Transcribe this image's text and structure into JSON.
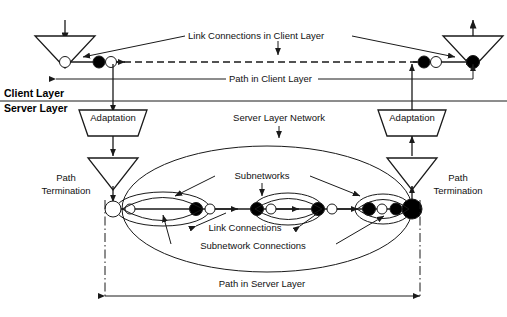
{
  "figure": {
    "background": "#ffffff",
    "line_color": "#1a1a1a"
  },
  "layers": {
    "client_label": "Client Layer",
    "server_label": "Server Layer",
    "divider_y": 101
  },
  "annotations": {
    "link_connections_client": "Link Connections in Client Layer",
    "path_client": "Path in Client Layer",
    "server_layer_network": "Server Layer Network",
    "subnetworks": "Subnetworks",
    "link_connections": "Link Connections",
    "subnetwork_connections": "Subnetwork Connections",
    "path_server": "Path in Server Layer"
  },
  "adaptation": {
    "left_label": "Adaptation",
    "right_label": "Adaptation"
  },
  "path_termination": {
    "left_line1": "Path",
    "left_line2": "Termination",
    "right_line1": "Path",
    "right_line2": "Termination"
  },
  "client_chain": {
    "y": 62,
    "nodes": [
      {
        "name": "client-tp-left-open",
        "x": 65,
        "r": 5.5,
        "fill": "white"
      },
      {
        "name": "client-cp-filled-left",
        "x": 99,
        "r": 6.0,
        "fill": "black"
      },
      {
        "name": "client-cp-open-left",
        "x": 111,
        "r": 5.5,
        "fill": "white"
      },
      {
        "name": "client-cp-filled-right",
        "x": 424,
        "r": 6.0,
        "fill": "black"
      },
      {
        "name": "client-cp-open-right",
        "x": 436,
        "r": 5.5,
        "fill": "white"
      },
      {
        "name": "client-tp-right-filled",
        "x": 473,
        "r": 6.5,
        "fill": "black"
      }
    ]
  },
  "server_chain": {
    "y": 209,
    "nodes": [
      {
        "name": "server-tp-left-open",
        "x": 113,
        "r": 8.0,
        "fill": "white"
      },
      {
        "name": "server-snp-open-1",
        "x": 130,
        "r": 5.0,
        "fill": "white"
      },
      {
        "name": "server-snp-filled-1",
        "x": 196,
        "r": 6.5,
        "fill": "black"
      },
      {
        "name": "server-snp-open-2",
        "x": 210,
        "r": 5.0,
        "fill": "white"
      },
      {
        "name": "server-snp-filled-2",
        "x": 257,
        "r": 6.5,
        "fill": "black"
      },
      {
        "name": "server-snp-open-3",
        "x": 271,
        "r": 5.0,
        "fill": "white"
      },
      {
        "name": "server-snp-filled-3",
        "x": 318,
        "r": 6.5,
        "fill": "black"
      },
      {
        "name": "server-snp-open-4",
        "x": 332,
        "r": 5.0,
        "fill": "white"
      },
      {
        "name": "server-snp-filled-4",
        "x": 369,
        "r": 6.5,
        "fill": "black"
      },
      {
        "name": "server-snp-open-5",
        "x": 382,
        "r": 5.0,
        "fill": "white"
      },
      {
        "name": "server-snp-filled-5",
        "x": 396,
        "r": 6.0,
        "fill": "black"
      },
      {
        "name": "server-tp-right-filled",
        "x": 412,
        "r": 10.0,
        "fill": "black"
      }
    ]
  },
  "subnetwork_ellipses": [
    {
      "name": "subnetwork-1",
      "cx": 163,
      "cy": 209,
      "rx": 47,
      "ry": 17
    },
    {
      "name": "subnetwork-2",
      "cx": 288,
      "cy": 209,
      "rx": 35,
      "ry": 16
    },
    {
      "name": "subnetwork-3",
      "cx": 383,
      "cy": 209,
      "rx": 28,
      "ry": 15
    }
  ],
  "server_network_ellipse": {
    "cx": 267,
    "cy": 209,
    "rx": 145,
    "ry": 63
  }
}
